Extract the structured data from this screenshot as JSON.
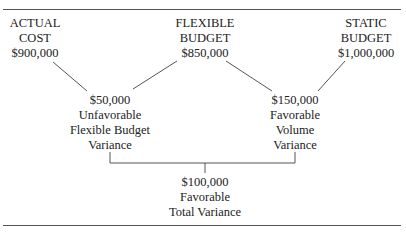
{
  "diagram": {
    "nodes": {
      "actual_cost": {
        "line1": "ACTUAL",
        "line2": "COST",
        "value": "$900,000"
      },
      "flexible_budget": {
        "line1": "FLEXIBLE",
        "line2": "BUDGET",
        "value": "$850,000"
      },
      "static_budget": {
        "line1": "STATIC",
        "line2": "BUDGET",
        "value": "$1,000,000"
      }
    },
    "variances": {
      "flexible_budget_variance": {
        "amount": "$50,000",
        "type": "Unfavorable",
        "name1": "Flexible Budget",
        "name2": "Variance"
      },
      "volume_variance": {
        "amount": "$150,000",
        "type": "Favorable",
        "name1": "Volume",
        "name2": "Variance"
      },
      "total_variance": {
        "amount": "$100,000",
        "type": "Favorable",
        "name1": "Total Variance"
      }
    },
    "colors": {
      "line": "#555555",
      "text": "#222222"
    }
  }
}
